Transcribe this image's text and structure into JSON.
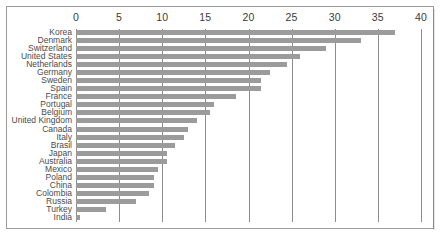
{
  "chart_data": {
    "type": "bar",
    "orientation": "horizontal",
    "title": "",
    "subtitle": "",
    "xlabel": "",
    "ylabel": "",
    "xlim": [
      0,
      40
    ],
    "xticks": [
      0,
      5,
      10,
      15,
      20,
      25,
      30,
      35,
      40
    ],
    "xtick_labels": [
      "0",
      "5",
      "10",
      "15",
      "20",
      "25",
      "30",
      "35",
      "40"
    ],
    "grid": true,
    "grid_axis": "x",
    "legend": null,
    "axis_position": "top",
    "bar_color": "#9b9b9b",
    "grid_color": "#8d8d8d",
    "categories": [
      "Korea",
      "Denmark",
      "Switzerland",
      "United States",
      "Netherlands",
      "Germany",
      "Sweden",
      "Spain",
      "France",
      "Portugal",
      "Belgium",
      "United Kingdom",
      "Canada",
      "Italy",
      "Brasil",
      "Japan",
      "Australia",
      "Mexico",
      "Poland",
      "China",
      "Colombia",
      "Russia",
      "Turkey",
      "India"
    ],
    "values": [
      37.0,
      33.0,
      29.0,
      26.0,
      24.5,
      22.5,
      21.5,
      21.5,
      18.5,
      16.0,
      15.5,
      14.0,
      13.0,
      12.5,
      11.5,
      10.5,
      10.5,
      9.5,
      9.0,
      9.0,
      8.5,
      7.0,
      3.5,
      0.5
    ]
  }
}
